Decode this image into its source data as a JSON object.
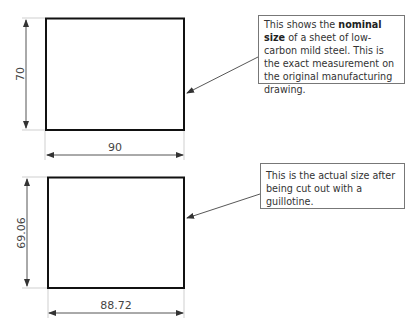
{
  "diagram": {
    "colors": {
      "outline": "#111111",
      "dimension": "#444444",
      "extension": "#cccccc",
      "callout_border": "#777777"
    },
    "panels": [
      {
        "id": "nominal",
        "width_label": "90",
        "height_label": "70",
        "callout": {
          "text_before": "This shows the ",
          "bold": "nominal size",
          "text_after": " of a sheet of low-carbon mild steel. This is the exact measurement on the original manufacturing drawing."
        }
      },
      {
        "id": "actual",
        "width_label": "88.72",
        "height_label": "69.06",
        "callout": {
          "text": "This is the actual size after being cut out with a guillotine."
        }
      }
    ]
  }
}
